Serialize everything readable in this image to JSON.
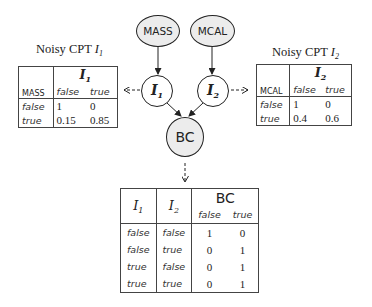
{
  "nodes": {
    "mass": "MASS",
    "mcal": "MCAL",
    "i1": {
      "base": "I",
      "sub": "1"
    },
    "i2": {
      "base": "I",
      "sub": "2"
    },
    "bc": "BC"
  },
  "cpt1": {
    "title": "Noisy CPT ",
    "title_var": "I",
    "title_sub": "1",
    "parent": "MASS",
    "child": {
      "base": "I",
      "sub": "1"
    },
    "cols": [
      "false",
      "true"
    ],
    "rows": [
      {
        "label": "false",
        "values": [
          "1",
          "0"
        ]
      },
      {
        "label": "true",
        "values": [
          "0.15",
          "0.85"
        ]
      }
    ]
  },
  "cpt2": {
    "title": "Noisy CPT ",
    "title_var": "I",
    "title_sub": "2",
    "parent": "MCAL",
    "child": {
      "base": "I",
      "sub": "2"
    },
    "cols": [
      "false",
      "true"
    ],
    "rows": [
      {
        "label": "false",
        "values": [
          "1",
          "0"
        ]
      },
      {
        "label": "true",
        "values": [
          "0.4",
          "0.6"
        ]
      }
    ]
  },
  "bc_table": {
    "parents": [
      {
        "base": "I",
        "sub": "1"
      },
      {
        "base": "I",
        "sub": "2"
      }
    ],
    "child": "BC",
    "cols": [
      "false",
      "true"
    ],
    "rows": [
      {
        "p": [
          "false",
          "false"
        ],
        "values": [
          "1",
          "0"
        ]
      },
      {
        "p": [
          "false",
          "true"
        ],
        "values": [
          "0",
          "1"
        ]
      },
      {
        "p": [
          "true",
          "false"
        ],
        "values": [
          "0",
          "1"
        ]
      },
      {
        "p": [
          "true",
          "true"
        ],
        "values": [
          "0",
          "1"
        ]
      }
    ]
  }
}
